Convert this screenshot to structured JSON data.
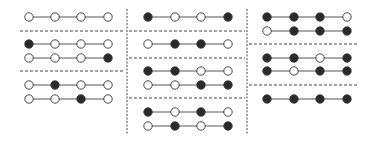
{
  "diagram": {
    "width": 373,
    "height": 141,
    "colors": {
      "filled": "#2a2a2a",
      "empty": "#ffffff",
      "stroke": "#333333",
      "line": "#555555",
      "divider": "#444444"
    },
    "node_radius": 4.2,
    "columns": [
      {
        "name": "column-1",
        "node_x": [
          29,
          55,
          81,
          108
        ],
        "dividers_y": [
          31,
          71
        ],
        "divider_x": [
          20,
          125
        ],
        "groups": [
          {
            "rows": [
              {
                "y": 17,
                "states": [
                  0,
                  0,
                  0,
                  0
                ]
              }
            ]
          },
          {
            "rows": [
              {
                "y": 44,
                "states": [
                  1,
                  0,
                  0,
                  0
                ]
              },
              {
                "y": 58,
                "states": [
                  0,
                  0,
                  0,
                  1
                ]
              }
            ]
          },
          {
            "rows": [
              {
                "y": 85,
                "states": [
                  0,
                  1,
                  0,
                  0
                ]
              },
              {
                "y": 99,
                "states": [
                  0,
                  0,
                  1,
                  0
                ]
              }
            ]
          }
        ]
      },
      {
        "name": "column-2",
        "node_x": [
          148,
          175,
          201,
          228
        ],
        "dividers_y": [
          31,
          58,
          98
        ],
        "divider_x": [
          129,
          245
        ],
        "groups": [
          {
            "rows": [
              {
                "y": 17,
                "states": [
                  1,
                  0,
                  0,
                  1
                ]
              }
            ]
          },
          {
            "rows": [
              {
                "y": 44,
                "states": [
                  0,
                  1,
                  1,
                  0
                ]
              }
            ]
          },
          {
            "rows": [
              {
                "y": 71,
                "states": [
                  1,
                  1,
                  0,
                  0
                ]
              },
              {
                "y": 85,
                "states": [
                  0,
                  0,
                  1,
                  1
                ]
              }
            ]
          },
          {
            "rows": [
              {
                "y": 112,
                "states": [
                  1,
                  0,
                  1,
                  0
                ]
              },
              {
                "y": 126,
                "states": [
                  0,
                  1,
                  0,
                  1
                ]
              }
            ]
          }
        ]
      },
      {
        "name": "column-3",
        "node_x": [
          267,
          294,
          320,
          347
        ],
        "dividers_y": [
          44,
          85
        ],
        "divider_x": [
          249,
          358
        ],
        "groups": [
          {
            "rows": [
              {
                "y": 17,
                "states": [
                  1,
                  1,
                  1,
                  0
                ]
              },
              {
                "y": 31,
                "states": [
                  0,
                  1,
                  1,
                  1
                ]
              }
            ]
          },
          {
            "rows": [
              {
                "y": 58,
                "states": [
                  1,
                  1,
                  0,
                  1
                ]
              },
              {
                "y": 71,
                "states": [
                  1,
                  0,
                  1,
                  1
                ]
              }
            ]
          },
          {
            "rows": [
              {
                "y": 99,
                "states": [
                  1,
                  1,
                  1,
                  1
                ]
              }
            ]
          }
        ]
      }
    ],
    "vertical_separators": [
      {
        "x": 127,
        "y1": 9,
        "y2": 135
      },
      {
        "x": 247,
        "y1": 9,
        "y2": 135
      }
    ]
  }
}
